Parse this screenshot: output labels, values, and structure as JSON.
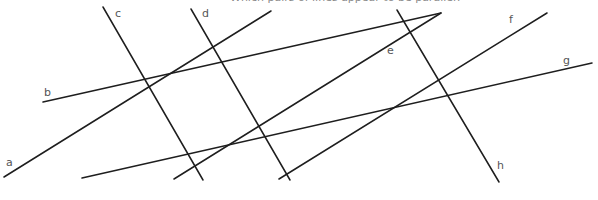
{
  "caption": "Which pairs of lines appear to be parallel?",
  "line_color": "#1e1e1e",
  "label_color": "#555555",
  "lines": [
    {
      "id": "a",
      "x1": 4,
      "y1": 177,
      "x2": 271,
      "y2": 11
    },
    {
      "id": "b",
      "x1": 43,
      "y1": 102,
      "x2": 441,
      "y2": 13
    },
    {
      "id": "c",
      "x1": 103,
      "y1": 7,
      "x2": 203,
      "y2": 180
    },
    {
      "id": "d",
      "x1": 191,
      "y1": 9,
      "x2": 290,
      "y2": 180
    },
    {
      "id": "e",
      "x1": 174,
      "y1": 179,
      "x2": 441,
      "y2": 13
    },
    {
      "id": "f",
      "x1": 279,
      "y1": 179,
      "x2": 547,
      "y2": 13
    },
    {
      "id": "g",
      "x1": 82,
      "y1": 178,
      "x2": 592,
      "y2": 63
    },
    {
      "id": "h",
      "x1": 397,
      "y1": 10,
      "x2": 499,
      "y2": 182
    }
  ],
  "labels": [
    {
      "text": "a",
      "x": 6,
      "y": 157
    },
    {
      "text": "b",
      "x": 44,
      "y": 87
    },
    {
      "text": "c",
      "x": 115,
      "y": 8
    },
    {
      "text": "d",
      "x": 202,
      "y": 8
    },
    {
      "text": "e",
      "x": 387,
      "y": 45
    },
    {
      "text": "f",
      "x": 509,
      "y": 14
    },
    {
      "text": "g",
      "x": 563,
      "y": 55
    },
    {
      "text": "h",
      "x": 497,
      "y": 160
    }
  ]
}
